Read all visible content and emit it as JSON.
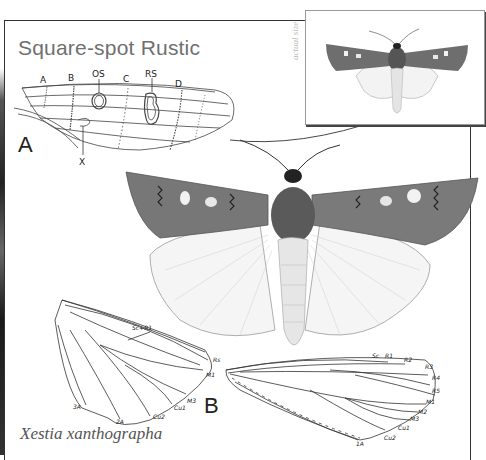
{
  "plate": {
    "title": "Square-spot Rustic",
    "species_caption": "Xestia xanthographa",
    "inset_label": "actual size",
    "figure_a_letter": "A",
    "figure_b_letter": "B"
  },
  "figure_a": {
    "description": "Forewing pattern diagram",
    "labels": [
      "A",
      "B",
      "OS",
      "C",
      "RS",
      "D",
      "X"
    ]
  },
  "figure_b": {
    "hindwing_labels": [
      "Sc+R1",
      "Rs",
      "M1",
      "M3",
      "Cu1",
      "Cu2",
      "2A",
      "3A"
    ],
    "forewing_labels": [
      "Sc",
      "R1",
      "R2",
      "R3",
      "R4",
      "R5",
      "M1",
      "M2",
      "M3",
      "Cu1",
      "Cu2",
      "1A"
    ]
  },
  "colors": {
    "frame": "#333333",
    "title": "#707070",
    "wing_dark": "#6e6e6e",
    "wing_spot": "#f0f0f0",
    "hindwing": "#f4f4f4",
    "line": "#333333"
  }
}
